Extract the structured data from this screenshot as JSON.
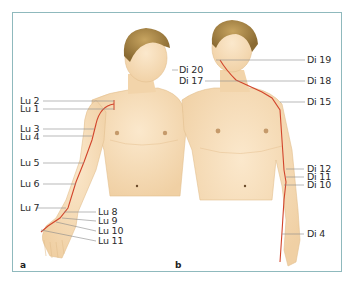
{
  "figure": {
    "panel_a_label": "a",
    "panel_b_label": "b",
    "colors": {
      "frame": "#8fb9bd",
      "skin": "#f6dcb6",
      "skin_shadow": "#e9c79a",
      "hair": "#9a7a3e",
      "meridian": "#d2452c",
      "leader": "#8a8a8a",
      "text": "#2b2b2b"
    }
  },
  "panel_a": {
    "meridian": "Lung",
    "points": [
      {
        "label": "Lu 2"
      },
      {
        "label": "Lu 1"
      },
      {
        "label": "Lu 3"
      },
      {
        "label": "Lu 4"
      },
      {
        "label": "Lu 5"
      },
      {
        "label": "Lu 6"
      },
      {
        "label": "Lu 7"
      },
      {
        "label": "Lu 8"
      },
      {
        "label": "Lu 9"
      },
      {
        "label": "Lu 10"
      },
      {
        "label": "Lu 11"
      }
    ]
  },
  "panel_b": {
    "meridian": "Large Intestine",
    "points": [
      {
        "label": "Di 20"
      },
      {
        "label": "Di 17"
      },
      {
        "label": "Di 19"
      },
      {
        "label": "Di 18"
      },
      {
        "label": "Di 15"
      },
      {
        "label": "Di 12"
      },
      {
        "label": "Di 11"
      },
      {
        "label": "Di 10"
      },
      {
        "label": "Di 4"
      }
    ]
  }
}
